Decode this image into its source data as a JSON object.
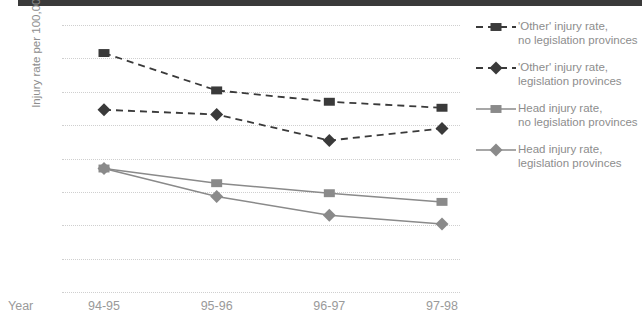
{
  "chart_data": {
    "type": "line",
    "title": "",
    "xlabel": "Year",
    "ylabel": "Injury rate per 100,000",
    "categories": [
      "94-95",
      "95-96",
      "96-97",
      "97-98"
    ],
    "ylim": [
      0,
      40
    ],
    "yticks": [
      0,
      5,
      10,
      15,
      20,
      25,
      30,
      35,
      40
    ],
    "grid": true,
    "legend_position": "right",
    "series": [
      {
        "name": "'Other' injury rate,\nno legislation provinces",
        "marker": "square",
        "linestyle": "dashed",
        "color": "#3a3a3a",
        "values": [
          35.8,
          30.2,
          28.5,
          27.6
        ]
      },
      {
        "name": "'Other' injury rate,\nlegislation provinces",
        "marker": "diamond",
        "linestyle": "dashed",
        "color": "#3a3a3a",
        "values": [
          27.3,
          26.6,
          22.7,
          24.5
        ]
      },
      {
        "name": "Head injury rate,\nno legislation provinces",
        "marker": "square",
        "linestyle": "solid",
        "color": "#8a8a8a",
        "values": [
          18.5,
          16.3,
          14.8,
          13.5
        ]
      },
      {
        "name": "Head injury rate,\nlegislation provinces",
        "marker": "diamond",
        "linestyle": "solid",
        "color": "#8a8a8a",
        "values": [
          18.5,
          14.3,
          11.5,
          10.2
        ]
      }
    ]
  },
  "colors": {
    "dark": "#3a3a3a",
    "grey": "#8a8a8a",
    "gridline": "#cfcfcf",
    "text": "#8d8d8d",
    "top_rule": "#3a3a3a"
  }
}
